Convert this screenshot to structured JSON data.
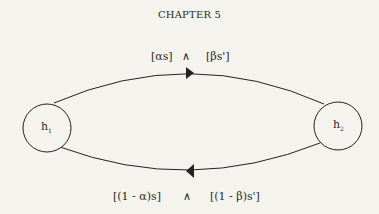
{
  "header": {
    "chapter": "CHAPTER 5"
  },
  "diagram": {
    "top_label": {
      "left": "[αs]",
      "op": "∧",
      "right": "[βs']"
    },
    "bottom_label": {
      "left": "[(1 - α)s]",
      "op": "∧",
      "right": "[(1 - β)s']"
    },
    "nodes": [
      {
        "name": "h",
        "sub": "1"
      },
      {
        "name": "h",
        "sub": "2"
      }
    ],
    "edges": [
      {
        "from": "h1",
        "to": "h2",
        "direction": "right",
        "position": "top"
      },
      {
        "from": "h2",
        "to": "h1",
        "direction": "left",
        "position": "bottom"
      }
    ],
    "line_color": "#222222"
  }
}
